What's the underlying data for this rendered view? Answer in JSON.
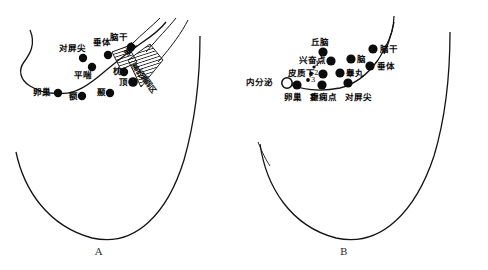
{
  "figure": {
    "title": "",
    "background_color": "#ffffff",
    "ink_color": "#111111",
    "width": 488,
    "height": 270
  },
  "panels": [
    {
      "id": "A",
      "caption": "A",
      "caption_x": 95,
      "caption_y": 246,
      "points": [
        {
          "name": "naogan",
          "label": "脑干",
          "cx": 131,
          "cy": 47,
          "r": 4.2,
          "lx": 110,
          "ly": 33,
          "rot": 0
        },
        {
          "name": "chuiti",
          "label": "垂体",
          "cx": 108,
          "cy": 55,
          "r": 4.2,
          "lx": 93,
          "ly": 38,
          "rot": 0
        },
        {
          "name": "duipingjian",
          "label": "对屏尖",
          "cx": 83,
          "cy": 58,
          "r": 4.2,
          "lx": 61,
          "ly": 44,
          "rot": 0
        },
        {
          "name": "pingchuan",
          "label": "平喘",
          "cx": 92,
          "cy": 67,
          "r": 4.2,
          "lx": 75,
          "ly": 73,
          "rot": 0
        },
        {
          "name": "zhen",
          "label": "枕",
          "cx": 124,
          "cy": 72,
          "r": 4.2,
          "lx": 112,
          "ly": 70,
          "rot": 0
        },
        {
          "name": "ding",
          "label": "顶",
          "cx": 133,
          "cy": 82,
          "r": 4.8,
          "lx": 118,
          "ly": 80,
          "rot": 0
        },
        {
          "name": "nie",
          "label": "颞",
          "cx": 110,
          "cy": 93,
          "r": 4.2,
          "lx": 96,
          "ly": 89,
          "rot": 0
        },
        {
          "name": "e",
          "label": "额",
          "cx": 82,
          "cy": 96,
          "r": 4.2,
          "lx": 68,
          "ly": 93,
          "rot": 0
        },
        {
          "name": "luanchao",
          "label": "卵巢",
          "cx": 58,
          "cy": 93,
          "r": 4.2,
          "lx": 37,
          "ly": 89,
          "rot": 0
        }
      ],
      "region_labels": [
        {
          "name": "naoqu",
          "label": "脑区",
          "lx": 120,
          "ly": 53,
          "rot": -50
        },
        {
          "name": "shenjingshuairuoqu",
          "label": "神经衰弱区",
          "lx": 139,
          "ly": 64,
          "rot": 50
        }
      ],
      "hatched_regions": [
        {
          "name": "naoqu-hatch",
          "points": "112,52 128,46 137,62 121,70"
        },
        {
          "name": "shenjing-hatch",
          "points": "128,60 148,46 162,62 140,86"
        }
      ]
    },
    {
      "id": "B",
      "caption": "B",
      "caption_x": 340,
      "caption_y": 246,
      "points": [
        {
          "name": "naogan",
          "label": "脑干",
          "cx": 373,
          "cy": 49,
          "r": 4.6,
          "lx": 380,
          "ly": 46,
          "rot": 0
        },
        {
          "name": "qiunao",
          "label": "丘脑",
          "cx": 323,
          "cy": 52,
          "r": 4.6,
          "lx": 312,
          "ly": 39,
          "rot": 0
        },
        {
          "name": "chuiti",
          "label": "垂体",
          "cx": 370,
          "cy": 66,
          "r": 4.6,
          "lx": 377,
          "ly": 63,
          "rot": 0
        },
        {
          "name": "nao",
          "label": "脑",
          "cx": 351,
          "cy": 59,
          "r": 4.6,
          "lx": 357,
          "ly": 57,
          "rot": 0
        },
        {
          "name": "xingfendian",
          "label": "兴奋点",
          "cx": 331,
          "cy": 61,
          "r": 4.6,
          "lx": 300,
          "ly": 57,
          "rot": 0
        },
        {
          "name": "gaowan",
          "label": "睾丸",
          "cx": 340,
          "cy": 73,
          "r": 4.6,
          "lx": 346,
          "ly": 70,
          "rot": 0
        },
        {
          "name": "pizhixia",
          "label": "皮质下",
          "cx": 323,
          "cy": 74,
          "r": 4.6,
          "lx": 288,
          "ly": 70,
          "rot": 0
        },
        {
          "name": "neifenmi",
          "label": "内分泌",
          "cx": 287,
          "cy": 83,
          "r": 5.2,
          "lx": 245,
          "ly": 79,
          "rot": 0,
          "hollow": true
        },
        {
          "name": "luanchao",
          "label": "卵巢",
          "cx": 297,
          "cy": 85,
          "r": 4.6,
          "lx": 284,
          "ly": 94,
          "rot": 0
        },
        {
          "name": "dianxiandian",
          "label": "癫痫点",
          "cx": 322,
          "cy": 85,
          "r": 4.6,
          "lx": 311,
          "ly": 94,
          "rot": 0
        },
        {
          "name": "duipingjian",
          "label": "对屏尖",
          "cx": 348,
          "cy": 83,
          "r": 4.6,
          "lx": 347,
          "ly": 94,
          "rot": 0
        }
      ],
      "small_points": [
        {
          "name": "pizhixia-1",
          "label": "1",
          "cx": 314,
          "cy": 67,
          "r": 1.6,
          "lx": 316,
          "ly": 62
        },
        {
          "name": "pizhixia-2",
          "label": "2",
          "cx": 311,
          "cy": 74,
          "r": 1.9,
          "lx": 314,
          "ly": 70
        },
        {
          "name": "pizhixia-3",
          "label": "3",
          "cx": 308,
          "cy": 80,
          "r": 1.9,
          "lx": 311,
          "ly": 77
        }
      ],
      "region_labels": [],
      "hatched_regions": []
    }
  ],
  "legend": {},
  "notes": ""
}
